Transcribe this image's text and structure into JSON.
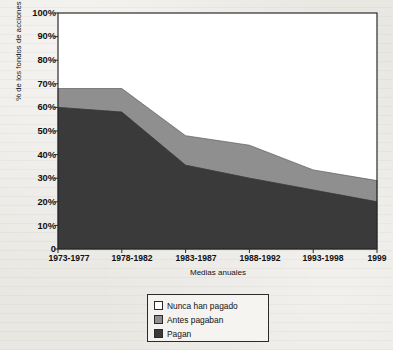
{
  "chart_data": {
    "type": "area",
    "stacked": true,
    "title": "",
    "xlabel": "Medias anuales",
    "ylabel": "% de los fondos de acciones estadounidenses",
    "categories": [
      "1973-1977",
      "1978-1982",
      "1983-1987",
      "1988-1992",
      "1993-1998",
      "1999"
    ],
    "ylim": [
      0,
      100
    ],
    "ytick_labels": [
      "100%",
      "90%",
      "80%",
      "70%",
      "60%",
      "50%",
      "40%",
      "30%",
      "20%",
      "10%",
      "0"
    ],
    "ytick_values": [
      100,
      90,
      80,
      70,
      60,
      50,
      40,
      30,
      20,
      10,
      0
    ],
    "grid": false,
    "legend_position": "bottom-center",
    "series": [
      {
        "name": "Nunca han pagado",
        "color": "#ffffff",
        "values": [
          32,
          32,
          52,
          56,
          66.5,
          71
        ]
      },
      {
        "name": "Antes pagaban",
        "color": "#8f8f8f",
        "values": [
          8,
          10,
          12.5,
          14,
          8.5,
          9
        ]
      },
      {
        "name": "Pagan",
        "color": "#3a3a3a",
        "values": [
          60,
          58,
          35.5,
          30,
          25,
          20
        ]
      }
    ],
    "cumulative_tops": {
      "pagan": [
        60,
        58,
        35.5,
        30,
        25,
        20
      ],
      "pagan_mas_antes": [
        68,
        68,
        48,
        44,
        33.5,
        29
      ]
    }
  },
  "legend": {
    "items": [
      {
        "label": "Nunca han pagado",
        "swatch": "white-swatch"
      },
      {
        "label": "Antes pagaban",
        "swatch": "gray-swatch"
      },
      {
        "label": "Pagan",
        "swatch": "dark-swatch"
      }
    ]
  },
  "colors": {
    "never_paid": "#ffffff",
    "formerly_paid": "#8f8f8f",
    "pay": "#3a3a3a",
    "axis": "#2b2b2b",
    "page_background": "#e9e7e2"
  }
}
